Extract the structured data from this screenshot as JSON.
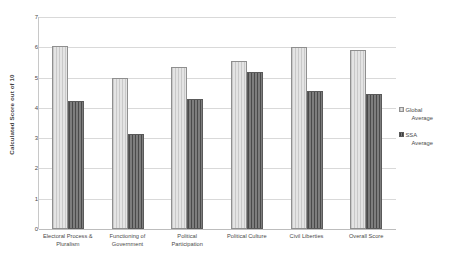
{
  "chart_data": {
    "type": "bar",
    "title": "",
    "xlabel": "",
    "ylabel": "Calculated Score out of 10",
    "ylim": [
      0,
      7
    ],
    "yticks": [
      0,
      1,
      2,
      3,
      4,
      5,
      6,
      7
    ],
    "grid": true,
    "legend_position": "right",
    "categories": [
      "Electoral Process & Pluralism",
      "Functioning of Government",
      "Political Participation",
      "Political Culture",
      "Civil Liberties",
      "Overall Score"
    ],
    "series": [
      {
        "name": "Global Average",
        "values": [
          6.05,
          5.0,
          5.35,
          5.55,
          6.0,
          5.9
        ]
      },
      {
        "name": "SSA Average",
        "values": [
          4.22,
          3.15,
          4.3,
          5.2,
          4.55,
          4.45
        ]
      }
    ]
  },
  "axis": {
    "y_title": "Calculated Score out of 10",
    "y_tick_labels": [
      "7",
      "6",
      "5",
      "4",
      "3",
      "2",
      "1",
      "0"
    ],
    "x_tick_labels": [
      [
        "Electoral Process &",
        "Pluralism"
      ],
      [
        "Functioning of",
        "Government"
      ],
      [
        "Political",
        "Participation"
      ],
      [
        "Political Culture"
      ],
      [
        "Civil Liberties"
      ],
      [
        "Overall Score"
      ]
    ]
  },
  "legend": {
    "entries": [
      {
        "line1": "Global",
        "line2": "Average",
        "swatch": "global-series-swatch"
      },
      {
        "line1": "SSA",
        "line2": "Average",
        "swatch": "ssa-series-swatch"
      }
    ]
  },
  "colors": {
    "global_series": "#d6d6d6",
    "ssa_series": "#6e6e6e",
    "gridline": "#d9d9d9",
    "axis": "#bdbdbd",
    "text": "#4a4a4a"
  }
}
